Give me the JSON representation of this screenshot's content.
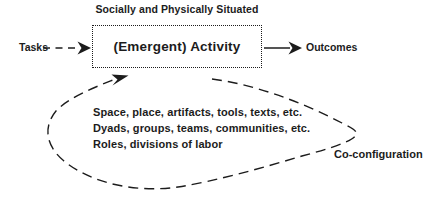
{
  "diagram": {
    "situated_label": "Socially and Physically Situated",
    "activity_label": "(Emergent) Activity",
    "tasks_label": "Tasks",
    "outcomes_label": "Outcomes",
    "loop_lines": {
      "0": "Space, place, artifacts, tools, texts, etc.",
      "1": "Dyads, groups, teams, communities, etc.",
      "2": "Roles, divisions of labor"
    },
    "coconfig_label": "Co-configuration",
    "colors": {
      "ink": "#1c1c1c",
      "background": "#ffffff"
    }
  }
}
